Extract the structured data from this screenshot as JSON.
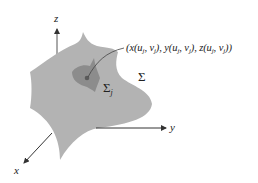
{
  "diagram": {
    "type": "surface-patch-3d",
    "axes": {
      "x_label": "x",
      "y_label": "y",
      "z_label": "z"
    },
    "surface_label": "Σ",
    "patch_label": {
      "symbol": "Σ",
      "subscript": "j"
    },
    "point_label": "(x(uj, vj), y(uj, vj), z(uj, vj))",
    "colors": {
      "surface": "#b3b3b3",
      "patch": "#8c8c8c",
      "point": "#5a5a5a",
      "axis": "#333333",
      "leader_line": "#444444"
    }
  }
}
